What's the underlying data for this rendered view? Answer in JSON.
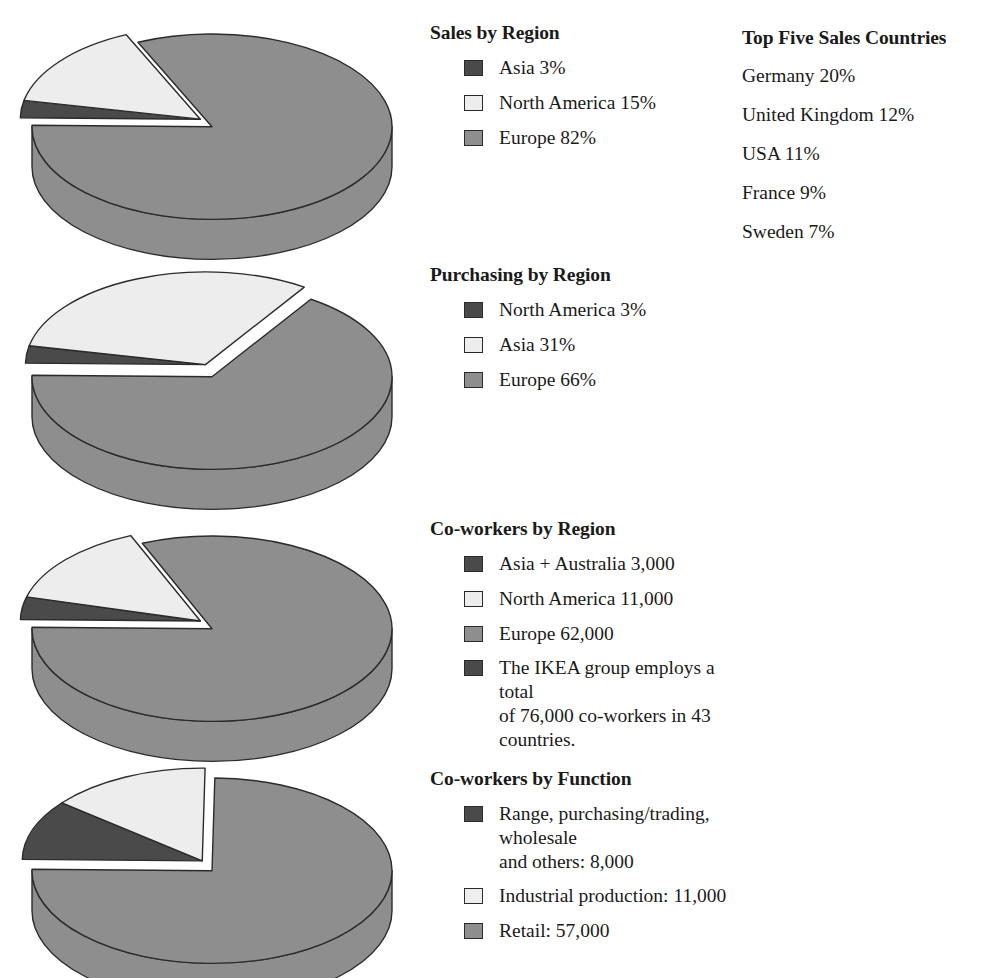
{
  "palette": {
    "dark": "#4a4a4a",
    "light": "#ededed",
    "mid": "#8e8e8e",
    "outline": "#2b2b2b",
    "background": "#ffffff",
    "text": "#1a1a1a"
  },
  "sections": [
    {
      "id": "sales-by-region",
      "heading": "Sales by Region",
      "legend": [
        {
          "label": "Asia 3%",
          "color_key": "dark"
        },
        {
          "label": "North America 15%",
          "color_key": "light"
        },
        {
          "label": "Europe 82%",
          "color_key": "mid"
        }
      ],
      "chart_data": {
        "type": "pie",
        "title": "Sales by Region",
        "categories": [
          "Asia",
          "North America",
          "Europe"
        ],
        "values": [
          3,
          15,
          82
        ],
        "unit": "%",
        "exploded": [
          "Asia",
          "North America"
        ],
        "colors": [
          "#4a4a4a",
          "#ededed",
          "#8e8e8e"
        ],
        "three_d": true,
        "legend_position": "right"
      }
    },
    {
      "id": "purchasing-by-region",
      "heading": "Purchasing by Region",
      "legend": [
        {
          "label": "North America 3%",
          "color_key": "dark"
        },
        {
          "label": "Asia 31%",
          "color_key": "light"
        },
        {
          "label": "Europe 66%",
          "color_key": "mid"
        }
      ],
      "chart_data": {
        "type": "pie",
        "title": "Purchasing by Region",
        "categories": [
          "North America",
          "Asia",
          "Europe"
        ],
        "values": [
          3,
          31,
          66
        ],
        "unit": "%",
        "exploded": [
          "North America",
          "Asia"
        ],
        "colors": [
          "#4a4a4a",
          "#ededed",
          "#8e8e8e"
        ],
        "three_d": true,
        "legend_position": "right"
      }
    },
    {
      "id": "co-workers-by-region",
      "heading": "Co-workers by Region",
      "legend": [
        {
          "label": "Asia + Australia 3,000",
          "color_key": "dark"
        },
        {
          "label": "North America 11,000",
          "color_key": "light"
        },
        {
          "label": "Europe 62,000",
          "color_key": "mid"
        },
        {
          "label": "The IKEA group employs a total\nof 76,000 co-workers in 43 countries.",
          "color_key": "dark"
        }
      ],
      "chart_data": {
        "type": "pie",
        "title": "Co-workers by Region",
        "categories": [
          "Asia + Australia",
          "North America",
          "Europe"
        ],
        "values": [
          3000,
          11000,
          62000
        ],
        "unit": "co-workers",
        "exploded": [
          "Asia + Australia",
          "North America"
        ],
        "colors": [
          "#4a4a4a",
          "#ededed",
          "#8e8e8e"
        ],
        "three_d": true,
        "legend_position": "right",
        "note": "The IKEA group employs a total of 76,000 co-workers in 43 countries."
      }
    },
    {
      "id": "co-workers-by-function",
      "heading": "Co-workers by Function",
      "legend": [
        {
          "label": "Range, purchasing/trading, wholesale\nand others: 8,000",
          "color_key": "dark"
        },
        {
          "label": "Industrial production: 11,000",
          "color_key": "light"
        },
        {
          "label": "Retail: 57,000",
          "color_key": "mid"
        }
      ],
      "chart_data": {
        "type": "pie",
        "title": "Co-workers by Function",
        "categories": [
          "Range, purchasing/trading, wholesale and others",
          "Industrial production",
          "Retail"
        ],
        "values": [
          8000,
          11000,
          57000
        ],
        "unit": "co-workers",
        "exploded": [
          "Range, purchasing/trading, wholesale and others",
          "Industrial production"
        ],
        "colors": [
          "#4a4a4a",
          "#ededed",
          "#8e8e8e"
        ],
        "three_d": true,
        "legend_position": "right"
      }
    }
  ],
  "countries": {
    "heading": "Top Five Sales Countries",
    "items": [
      "Germany 20%",
      "United Kingdom 12%",
      "USA 11%",
      "France 9%",
      "Sweden 7%"
    ]
  },
  "layout": {
    "pie_tops": [
      18,
      268,
      520,
      762
    ],
    "legend_tops": [
      22,
      264,
      518,
      768
    ],
    "pie_width": 392,
    "pie_height": 200
  }
}
